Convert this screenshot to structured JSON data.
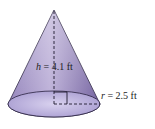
{
  "figure": {
    "shape": "cone",
    "height_label": {
      "var": "h",
      "eq": " = ",
      "value": "4.1 ft"
    },
    "radius_label": {
      "var": "r",
      "eq": " = ",
      "value": "2.5 ft"
    }
  },
  "colors": {
    "cone_top": "#c9bde0",
    "cone_bottom": "#6e5a9e",
    "base_fill": "#c7bde6",
    "stroke": "#2a2240",
    "dash": "#1e1a2c"
  }
}
